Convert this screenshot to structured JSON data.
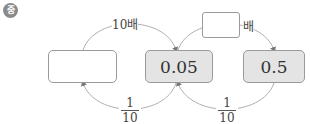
{
  "badge": {
    "text": "중",
    "color": "#8a8a8a"
  },
  "boxes": [
    {
      "value": "",
      "style": "blank"
    },
    {
      "value": "0.05",
      "style": "filled"
    },
    {
      "value": "0.5",
      "style": "filled"
    }
  ],
  "top_labels": {
    "left": "10배",
    "right_suffix": "배",
    "right_blank": ""
  },
  "bottom_labels": [
    {
      "numerator": "1",
      "denominator": "10"
    },
    {
      "numerator": "1",
      "denominator": "10"
    }
  ],
  "colors": {
    "box_fill": "#e4e4e4",
    "box_border": "#9a9a9a",
    "arc": "#b0b0b0"
  }
}
